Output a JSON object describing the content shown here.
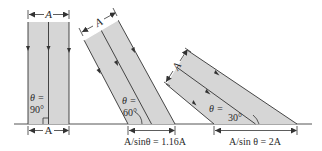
{
  "diagram": {
    "colors": {
      "beam_fill": "#d6d6d6",
      "line": "#333333",
      "background": "#ffffff"
    },
    "beams": [
      {
        "id": "beam-90",
        "theta_label": "θ =",
        "theta_value": "90°",
        "width_label": "A",
        "footprint_label": "A"
      },
      {
        "id": "beam-60",
        "theta_label": "θ =",
        "theta_value": "60°",
        "width_label": "A",
        "footprint_label": "A/sinθ = 1.16A"
      },
      {
        "id": "beam-30",
        "theta_label": "θ =",
        "theta_value": "30°",
        "width_label": "A",
        "footprint_label": "A/sin θ = 2A"
      }
    ]
  }
}
